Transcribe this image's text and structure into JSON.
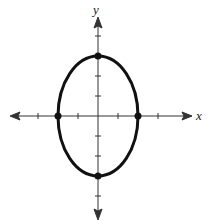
{
  "figure": {
    "type": "ellipse-graph",
    "x_axis_label": "x",
    "y_axis_label": "y",
    "origin_px": [
      98,
      116
    ],
    "unit_px": 20,
    "x_ticks": [
      -3,
      -2,
      -1,
      1,
      2,
      3
    ],
    "y_ticks": [
      -4,
      -3,
      -2,
      -1,
      1,
      2,
      3,
      4
    ],
    "x_range": [
      -4.3,
      4.3
    ],
    "y_range": [
      -5.4,
      4.6
    ]
  },
  "ellipse": {
    "center": [
      0,
      0
    ],
    "semi_axis_x": 2,
    "semi_axis_y": 3,
    "equation": "x^2/4 + y^2/9 = 1",
    "stroke_color": "#111111"
  },
  "points": [
    {
      "label": "vertex-top",
      "x": 0,
      "y": 3
    },
    {
      "label": "vertex-bottom",
      "x": 0,
      "y": -3
    },
    {
      "label": "intercept-left",
      "x": -2,
      "y": 0
    },
    {
      "label": "intercept-right",
      "x": 2,
      "y": 0
    }
  ]
}
